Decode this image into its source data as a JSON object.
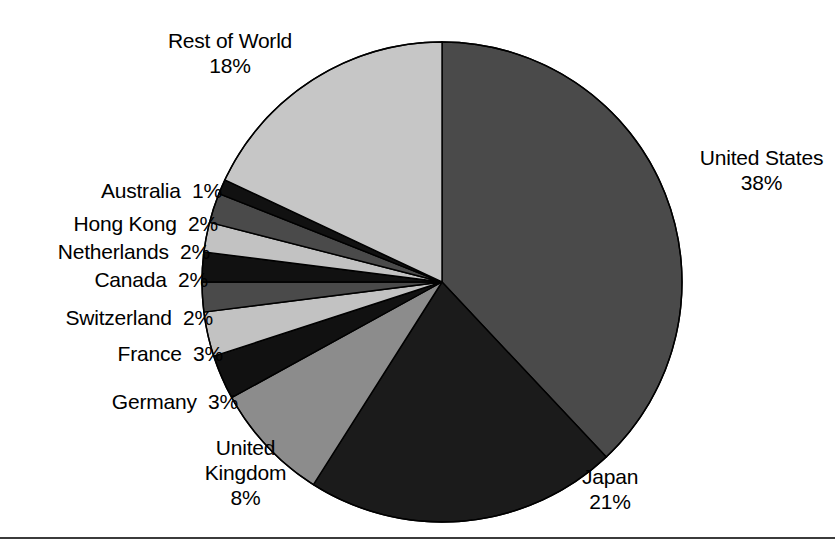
{
  "chart_data": {
    "type": "pie",
    "title": "",
    "subtitle": "",
    "xlabel": "",
    "ylabel": "",
    "legend_position": "none",
    "grid": false,
    "units": "%",
    "start_angle_deg": 0,
    "direction": "clockwise",
    "total": 100,
    "categories": [
      "United States",
      "Japan",
      "United Kingdom",
      "Germany",
      "France",
      "Switzerland",
      "Canada",
      "Netherlands",
      "Hong Kong",
      "Australia",
      "Rest of World"
    ],
    "values": [
      38,
      21,
      8,
      3,
      3,
      2,
      2,
      2,
      2,
      1,
      18
    ],
    "slices": [
      {
        "name": "United States",
        "value": 38,
        "value_text": "38%",
        "color": "#4a4a4a"
      },
      {
        "name": "Japan",
        "value": 21,
        "value_text": "21%",
        "color": "#1b1b1b"
      },
      {
        "name": "United Kingdom",
        "value": 8,
        "value_text": "8%",
        "color": "#8c8c8c"
      },
      {
        "name": "Germany",
        "value": 3,
        "value_text": "3%",
        "color": "#111111"
      },
      {
        "name": "France",
        "value": 3,
        "value_text": "3%",
        "color": "#c2c2c2"
      },
      {
        "name": "Switzerland",
        "value": 2,
        "value_text": "2%",
        "color": "#4a4a4a"
      },
      {
        "name": "Canada",
        "value": 2,
        "value_text": "2%",
        "color": "#111111"
      },
      {
        "name": "Netherlands",
        "value": 2,
        "value_text": "2%",
        "color": "#c2c2c2"
      },
      {
        "name": "Hong Kong",
        "value": 2,
        "value_text": "2%",
        "color": "#4a4a4a"
      },
      {
        "name": "Australia",
        "value": 1,
        "value_text": "1%",
        "color": "#111111"
      },
      {
        "name": "Rest of World",
        "value": 18,
        "value_text": "18%",
        "color": "#c6c6c6"
      }
    ]
  },
  "labels": [
    {
      "key": "rest-of-world",
      "lines": [
        "Rest of World",
        "18%"
      ],
      "align": "center",
      "left": 135,
      "top": 28,
      "width": 190
    },
    {
      "key": "united-states",
      "lines": [
        "United States",
        "38%"
      ],
      "align": "center",
      "left": 688,
      "top": 145,
      "width": 147
    },
    {
      "key": "australia",
      "lines": [
        "Australia  1%"
      ],
      "align": "right",
      "left": 0,
      "top": 178,
      "width": 222
    },
    {
      "key": "hong-kong",
      "lines": [
        "Hong Kong  2%"
      ],
      "align": "right",
      "left": 0,
      "top": 211,
      "width": 218
    },
    {
      "key": "netherlands",
      "lines": [
        "Netherlands  2%"
      ],
      "align": "right",
      "left": 0,
      "top": 239,
      "width": 210
    },
    {
      "key": "canada",
      "lines": [
        "Canada  2%"
      ],
      "align": "right",
      "left": 0,
      "top": 267,
      "width": 208
    },
    {
      "key": "switzerland",
      "lines": [
        "Switzerland  2%"
      ],
      "align": "right",
      "left": 0,
      "top": 305,
      "width": 213
    },
    {
      "key": "france",
      "lines": [
        "France  3%"
      ],
      "align": "right",
      "left": 0,
      "top": 341,
      "width": 223
    },
    {
      "key": "germany",
      "lines": [
        "Germany  3%"
      ],
      "align": "right",
      "left": 0,
      "top": 389,
      "width": 238
    },
    {
      "key": "united-kingdom",
      "lines": [
        "United",
        "Kingdom",
        "8%"
      ],
      "align": "center",
      "left": 163,
      "top": 435,
      "width": 165
    },
    {
      "key": "japan",
      "lines": [
        "Japan",
        "21%"
      ],
      "align": "center",
      "left": 549,
      "top": 464,
      "width": 122
    }
  ],
  "geometry": {
    "center_x": 442,
    "center_y": 282,
    "radius": 240,
    "stroke": "#000000",
    "stroke_width": 1.4
  },
  "baseline_rule": {
    "top": 537,
    "color": "#3b3b3b"
  }
}
